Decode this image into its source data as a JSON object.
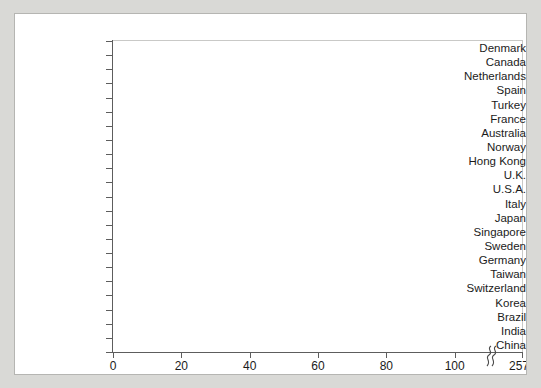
{
  "chart_data": {
    "type": "bar",
    "orientation": "horizontal",
    "title": "",
    "xlabel": "Return, %",
    "ylabel": "",
    "xlim": [
      0,
      110
    ],
    "xticks": [
      0,
      20,
      40,
      60,
      80,
      100
    ],
    "xtick_labels": [
      "0",
      "20",
      "40",
      "60",
      "80",
      "100"
    ],
    "axis_break": {
      "present": true,
      "after_value": 108,
      "final_tick_label": "257",
      "note": "axis is broken between 100 and 257; China bar is truncated"
    },
    "grid": false,
    "legend": null,
    "bar_color": "#3a3a3a",
    "categories": [
      "Denmark",
      "Canada",
      "Netherlands",
      "Spain",
      "Turkey",
      "France",
      "Australia",
      "Norway",
      "Hong Kong",
      "U.K.",
      "U.S.A.",
      "Italy",
      "Japan",
      "Singapore",
      "Sweden",
      "Germany",
      "Taiwan",
      "Switzerland",
      "Korea",
      "Brazil",
      "India",
      "China"
    ],
    "values": [
      6,
      8,
      10.5,
      10.5,
      11,
      11.5,
      12,
      13,
      18,
      18,
      19,
      22,
      29,
      30,
      31,
      31,
      31,
      35,
      74,
      79,
      95,
      257
    ]
  }
}
